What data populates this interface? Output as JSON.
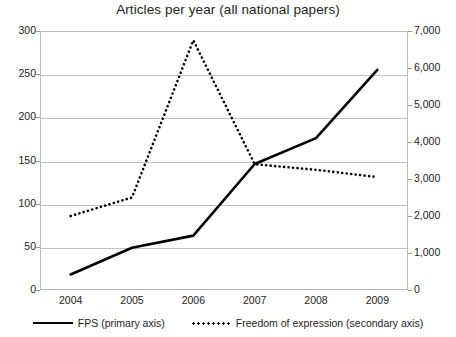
{
  "chart_data": {
    "type": "line",
    "title": "Articles per year (all national papers)",
    "xlabel": "",
    "ylabel": "",
    "categories": [
      "2004",
      "2005",
      "2006",
      "2007",
      "2008",
      "2009"
    ],
    "grid": true,
    "legend_position": "bottom",
    "primary_axis": {
      "name": "primary axis",
      "ylim": [
        0,
        300
      ],
      "ticks": [
        0,
        50,
        100,
        150,
        200,
        250,
        300
      ],
      "tick_labels": [
        "0",
        "50",
        "100",
        "150",
        "200",
        "250",
        "300"
      ]
    },
    "secondary_axis": {
      "name": "secondary axis",
      "ylim": [
        0,
        7000
      ],
      "ticks": [
        0,
        1000,
        2000,
        3000,
        4000,
        5000,
        6000,
        7000
      ],
      "tick_labels": [
        "0",
        "1,000",
        "2,000",
        "3,000",
        "4,000",
        "5,000",
        "6,000",
        "7,000"
      ]
    },
    "series": [
      {
        "name": "FPS (primary axis)",
        "legend_label": "FPS (primary axis)",
        "axis": "primary",
        "style": "solid",
        "color": "#000000",
        "values": [
          18,
          49,
          63,
          146,
          176,
          255
        ]
      },
      {
        "name": "Freedom of expression (secondary axis)",
        "legend_label": "Freedom of expression (secondary axis)",
        "axis": "secondary",
        "style": "dotted",
        "color": "#000000",
        "values": [
          2000,
          2500,
          6750,
          3400,
          3250,
          3050
        ]
      }
    ]
  },
  "legend": {
    "series_1_label": "FPS (primary axis)",
    "series_2_label": "Freedom of expression (secondary axis)"
  }
}
